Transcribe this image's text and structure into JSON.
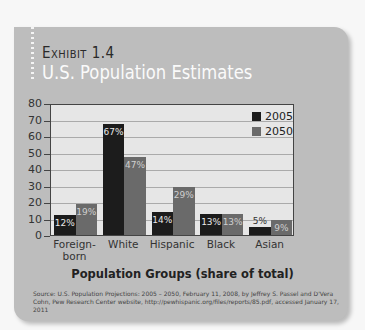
{
  "header": {
    "exhibit_label": "Exhibit 1.4",
    "title": "U.S. Population Estimates"
  },
  "colors": {
    "card_bg": "#bdbdbd",
    "plot_bg": "#e6e6e6",
    "series_2005": "#1c1c1c",
    "series_2050": "#6a6a6a"
  },
  "chart_data": {
    "type": "bar",
    "title": "U.S. Population Estimates",
    "xlabel": "Population Groups (share of total)",
    "ylabel": "",
    "ylim": [
      0,
      80
    ],
    "yticks": [
      0,
      10,
      20,
      30,
      40,
      50,
      60,
      70,
      80
    ],
    "grid": true,
    "legend_position": "top-right",
    "categories": [
      "Foreign-born",
      "White",
      "Hispanic",
      "Black",
      "Asian"
    ],
    "series": [
      {
        "name": "2005",
        "values": [
          12,
          67,
          14,
          13,
          5
        ],
        "labels": [
          "12%",
          "67%",
          "14%",
          "13%",
          "5%"
        ]
      },
      {
        "name": "2050",
        "values": [
          19,
          47,
          29,
          13,
          9
        ],
        "labels": [
          "19%",
          "47%",
          "29%",
          "13%",
          "9%"
        ]
      }
    ]
  },
  "axis": {
    "yticks": [
      "0",
      "10",
      "20",
      "30",
      "40",
      "50",
      "60",
      "70",
      "80"
    ],
    "categories": [
      "Foreign-\nborn",
      "White",
      "Hispanic",
      "Black",
      "Asian"
    ]
  },
  "legend": {
    "s2005": "2005",
    "s2050": "2050"
  },
  "source": "Source: U.S. Population Projections: 2005 – 2050, February 11, 2008, by Jeffrey S. Passel and D'Vera Cohn, Pew Research Center website, http://pewhispanic.org/files/reports/85.pdf, accessed January 17, 2011"
}
